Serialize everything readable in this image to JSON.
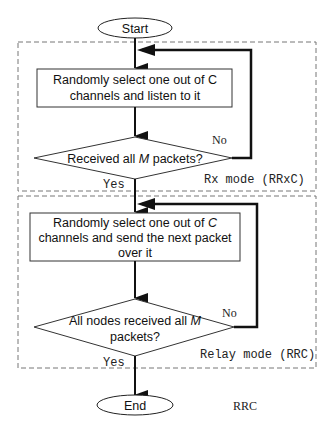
{
  "flowchart": {
    "start": {
      "label": "Start"
    },
    "end": {
      "label": "End"
    },
    "rx_region": {
      "label": "Rx mode (RRxC)"
    },
    "relay_region": {
      "label": "Relay mode (RRC)"
    },
    "rx_process": {
      "line1": "Randomly select one out of C",
      "line2": "channels and listen to it"
    },
    "rx_decision": {
      "prefix": "Received all ",
      "var": "M",
      "suffix": " packets?",
      "no_label": "No",
      "yes_label": "Yes"
    },
    "relay_process": {
      "line1_prefix": "Randomly select one out of ",
      "line1_var": "C",
      "line2": "channels and send the next packet",
      "line3": "over it"
    },
    "relay_decision": {
      "line1_prefix": "All nodes received all ",
      "line1_var": "M",
      "line2": "packets?",
      "no_label": "No",
      "yes_label": "Yes"
    },
    "caption": "RRC"
  }
}
